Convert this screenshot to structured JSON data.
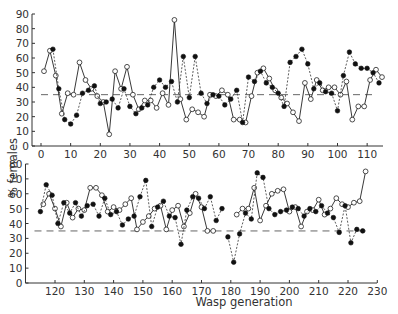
{
  "chart_data": {
    "type": "line",
    "ylabel": "% females",
    "xlabel": "Wasp generation",
    "reference_line": 35,
    "panels": [
      {
        "name": "top",
        "xlim": [
          0,
          115
        ],
        "ylim": [
          0,
          90
        ],
        "xticks": [
          0,
          10,
          20,
          30,
          40,
          50,
          60,
          70,
          80,
          90,
          100,
          110
        ],
        "yticks": [
          0,
          10,
          20,
          30,
          40,
          50,
          60,
          70,
          80,
          90
        ],
        "series": [
          {
            "name": "open-circles-solid-line",
            "marker": "open",
            "line": "solid",
            "x": [
              1,
              3,
              5,
              7,
              9,
              11,
              13,
              15,
              17,
              19,
              21,
              23,
              25,
              27,
              29,
              31,
              33,
              35,
              37,
              39,
              41,
              43,
              45,
              47,
              49,
              51,
              53,
              55,
              57,
              59,
              61,
              63,
              65,
              67,
              69,
              71,
              73,
              75,
              77,
              79,
              81,
              83,
              85,
              87,
              89,
              91,
              93,
              95,
              97,
              99,
              101,
              103,
              105,
              107,
              109,
              111,
              113,
              115
            ],
            "y": [
              51,
              65,
              48,
              22,
              36,
              35,
              57,
              45,
              39,
              34,
              30,
              8,
              51,
              39,
              54,
              35,
              25,
              31,
              31,
              26,
              36,
              28,
              86,
              32,
              18,
              25,
              23,
              20,
              35,
              34,
              38,
              35,
              18,
              18,
              16,
              34,
              50,
              53,
              46,
              38,
              33,
              29,
              23,
              17,
              43,
              32,
              45,
              38,
              40,
              40,
              35,
              44,
              18,
              27,
              27,
              45,
              52,
              47
            ]
          },
          {
            "name": "filled-circles-dashed-line",
            "marker": "filled",
            "line": "dashed",
            "x": [
              4,
              6,
              8,
              10,
              12,
              14,
              16,
              18,
              20,
              22,
              24,
              26,
              28,
              30,
              32,
              34,
              36,
              38,
              40,
              42,
              44,
              46,
              48,
              50,
              52,
              54,
              56,
              58,
              60,
              62,
              64,
              66,
              68,
              70,
              72,
              74,
              76,
              78,
              80,
              82,
              84,
              86,
              88,
              90,
              92,
              94,
              96,
              98,
              100,
              102,
              104,
              106,
              108,
              110,
              112,
              114
            ],
            "y": [
              66,
              39,
              18,
              15,
              21,
              36,
              38,
              41,
              29,
              30,
              32,
              26,
              39,
              27,
              22,
              26,
              28,
              40,
              45,
              40,
              44,
              30,
              61,
              33,
              61,
              36,
              29,
              35,
              34,
              28,
              32,
              38,
              16,
              47,
              44,
              51,
              43,
              40,
              36,
              27,
              57,
              61,
              66,
              56,
              39,
              43,
              37,
              36,
              24,
              48,
              64,
              56,
              53,
              53,
              50,
              43
            ]
          }
        ]
      },
      {
        "name": "bottom",
        "xlim": [
          113,
          230
        ],
        "ylim": [
          0,
          80
        ],
        "xticks": [
          120,
          130,
          140,
          150,
          160,
          170,
          180,
          190,
          200,
          210,
          220,
          230
        ],
        "yticks": [
          0,
          10,
          20,
          30,
          40,
          50,
          60,
          70,
          80
        ],
        "series": [
          {
            "name": "open-circles-solid-line",
            "marker": "open",
            "line": "solid",
            "x": [
              116,
              118,
              120,
              122,
              124,
              126,
              128,
              130,
              132,
              134,
              136,
              138,
              140,
              142,
              144,
              146,
              148,
              150,
              152,
              154,
              156,
              158,
              160,
              162,
              164,
              166,
              168,
              170,
              172,
              174,
              176,
              182,
              184,
              186,
              188,
              190,
              192,
              194,
              196,
              198,
              200,
              202,
              204,
              206,
              208,
              210,
              212,
              214,
              216,
              218,
              220,
              222,
              224,
              226
            ],
            "y": [
              53,
              60,
              50,
              38,
              54,
              44,
              50,
              49,
              64,
              64,
              59,
              48,
              51,
              49,
              53,
              57,
              36,
              41,
              45,
              50,
              52,
              36,
              49,
              52,
              38,
              47,
              60,
              51,
              35,
              35,
              null,
              46,
              50,
              50,
              64,
              42,
              52,
              60,
              62,
              63,
              48,
              51,
              38,
              48,
              49,
              56,
              46,
              50,
              57,
              53,
              51,
              54,
              55,
              75
            ],
            "segments": [
              [
                116,
                174
              ],
              [
                182,
                226
              ]
            ]
          },
          {
            "name": "filled-circles-dashed-line",
            "marker": "filled",
            "line": "dashed",
            "x": [
              115,
              117,
              119,
              121,
              123,
              125,
              127,
              129,
              131,
              133,
              135,
              137,
              139,
              141,
              143,
              145,
              147,
              149,
              151,
              153,
              155,
              157,
              159,
              161,
              163,
              165,
              167,
              169,
              171,
              173,
              175,
              177,
              179,
              181,
              183,
              185,
              187,
              189,
              191,
              193,
              195,
              197,
              199,
              201,
              203,
              205,
              207,
              209,
              211,
              213,
              215,
              217,
              219,
              221,
              223,
              225
            ],
            "y": [
              48,
              66,
              59,
              40,
              54,
              47,
              54,
              45,
              52,
              53,
              45,
              57,
              46,
              48,
              39,
              43,
              45,
              58,
              69,
              38,
              51,
              55,
              45,
              44,
              26,
              49,
              58,
              57,
              50,
              58,
              42,
              50,
              31,
              14,
              33,
              47,
              43,
              74,
              71,
              50,
              46,
              48,
              49,
              51,
              50,
              45,
              50,
              48,
              52,
              47,
              44,
              34,
              52,
              27,
              36,
              35
            ],
            "segments": [
              [
                115,
                177
              ],
              [
                179,
                225
              ]
            ]
          }
        ]
      }
    ]
  },
  "labels": {
    "ylabel": "% females",
    "xlabel": "Wasp generation"
  }
}
